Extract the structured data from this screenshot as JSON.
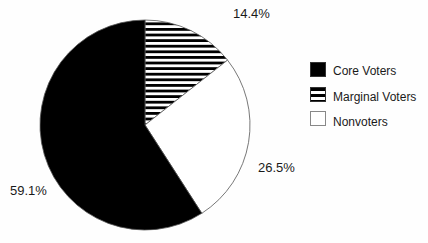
{
  "chart_data": {
    "type": "pie",
    "title": "",
    "categories": [
      "Core Voters",
      "Marginal Voters",
      "Nonvoters"
    ],
    "values": [
      59.1,
      14.4,
      26.5
    ],
    "labels": [
      "59.1%",
      "14.4%",
      "26.5%"
    ],
    "fills": [
      "solid-black",
      "horizontal-stripes",
      "white"
    ],
    "start_angle": "12 o'clock, clockwise: Marginal, Nonvoters, Core",
    "legend_position": "right"
  },
  "legend": {
    "items": [
      {
        "label": "Core Voters",
        "fill": "#000000"
      },
      {
        "label": "Marginal Voters",
        "fill": "stripes"
      },
      {
        "label": "Nonvoters",
        "fill": "#ffffff"
      }
    ]
  },
  "slice_labels": {
    "marginal": "14.4%",
    "nonvoters": "26.5%",
    "core": "59.1%"
  }
}
